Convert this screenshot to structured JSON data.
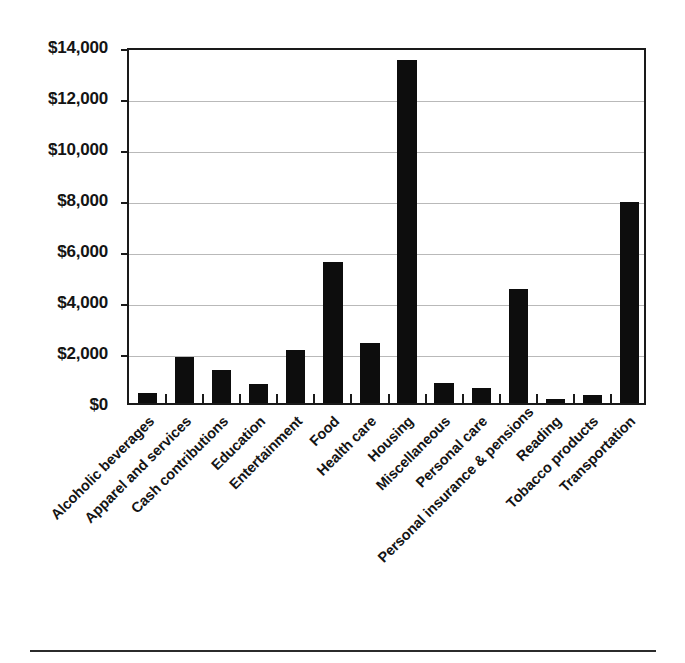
{
  "chart_data": {
    "type": "bar",
    "title": "",
    "subtitle": "",
    "xlabel": "",
    "ylabel": "",
    "grid": true,
    "legend": false,
    "ylim": [
      0,
      14000
    ],
    "ytick_values": [
      0,
      2000,
      4000,
      6000,
      8000,
      10000,
      12000,
      14000
    ],
    "ytick_labels": [
      "$0",
      "$2,000",
      "$4,000",
      "$6,000",
      "$8,000",
      "$10,000",
      "$12,000",
      "$14,000"
    ],
    "bar_color": "#0d0d0d",
    "axis_color": "#1a1a1a",
    "gridline_color": "#b9b9b9",
    "categories": [
      "Alcoholic beverages",
      "Apparel and services",
      "Cash contributions",
      "Education",
      "Entertainment",
      "Food",
      "Health care",
      "Housing",
      "Miscellaneous",
      "Personal care",
      "Personal insurance & pensions",
      "Reading",
      "Tobacco products",
      "Transportation"
    ],
    "values": [
      400,
      1800,
      1280,
      760,
      2080,
      5530,
      2350,
      13450,
      800,
      570,
      4480,
      150,
      300,
      7900
    ]
  }
}
